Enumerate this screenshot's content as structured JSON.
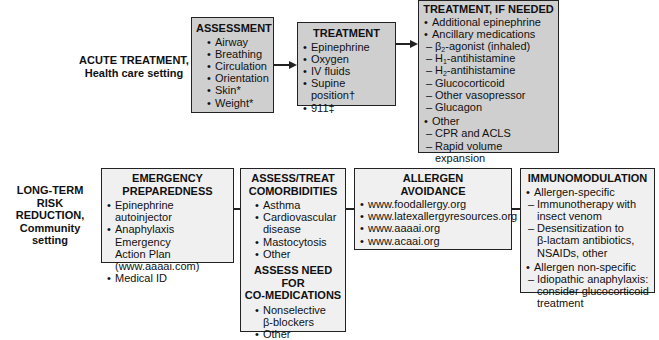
{
  "acute": {
    "label_line1": "ACUTE TREATMENT,",
    "label_line2": "Health care setting",
    "assessment": {
      "title": "ASSESSMENT",
      "items": [
        "Airway",
        "Breathing",
        "Circulation",
        "Orientation",
        "Skin*",
        "Weight*"
      ]
    },
    "treatment": {
      "title": "TREATMENT",
      "items": [
        "Epinephrine",
        "Oxygen",
        "IV fluids",
        "Supine position†",
        "911‡"
      ]
    },
    "if_needed": {
      "title": "TREATMENT, IF NEEDED",
      "item1": "Additional epinephrine",
      "item2": "Ancillary medications",
      "ancillary": [
        "β2-agonist (inhaled)",
        "H1-antihistamine",
        "H2-antihistamine",
        "Glucocorticoid",
        "Other vasopressor",
        "Glucagon"
      ],
      "item3": "Other",
      "other": [
        "CPR and ACLS",
        "Rapid volume expansion"
      ]
    }
  },
  "longterm": {
    "label_line1": "LONG-TERM",
    "label_line2": "RISK",
    "label_line3": "REDUCTION,",
    "label_line4": "Community setting",
    "emergency": {
      "title_line1": "EMERGENCY",
      "title_line2": "PREPAREDNESS",
      "item1": "Epinephrine autoinjector",
      "item2a": "Anaphylaxis Emergency",
      "item2b": "Action Plan",
      "item2c": "(www.aaaai.com)",
      "item3": "Medical ID"
    },
    "comorbid": {
      "title_line1": "ASSESS/TREAT",
      "title_line2": "COMORBIDITIES",
      "items": [
        "Asthma",
        "Cardiovascular",
        "disease",
        "Mastocytosis",
        "Other"
      ],
      "title2_line1": "ASSESS NEED FOR",
      "title2_line2": "CO-MEDICATIONS",
      "items2": [
        "Nonselective",
        "β-blockers",
        "Other"
      ]
    },
    "avoidance": {
      "title_line1": "ALLERGEN",
      "title_line2": "AVOIDANCE",
      "items": [
        "www.foodallergy.org",
        "www.latexallergyresources.org",
        "www.aaaai.org",
        "www.acaai.org"
      ]
    },
    "immuno": {
      "title": "IMMUNOMODULATION",
      "item1": "Allergen-specific",
      "sub1a": "Immunotherapy with",
      "sub1b": "insect venom",
      "sub2a": "Desensitization to",
      "sub2b": "β-lactam antibiotics,",
      "sub2c": "NSAIDs, other",
      "item2": "Allergen non-specific",
      "sub3a": "Idiopathic anaphylaxis:",
      "sub3b": "consider glucocorticoid",
      "sub3c": "treatment"
    }
  }
}
